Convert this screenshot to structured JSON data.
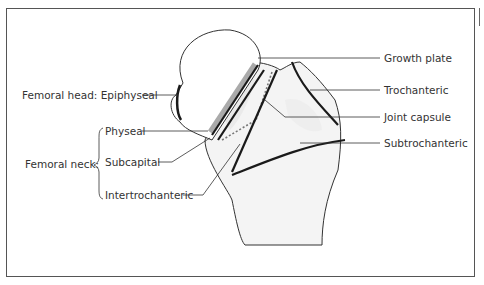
{
  "diagram": {
    "labels": {
      "femoral_head": "Femoral head: Epiphyseal",
      "femoral_neck_group": "Femoral neck:",
      "physeal": "Physeal",
      "subcapital": "Subcapital",
      "intertrochanteric": "Intertrochanteric",
      "growth_plate": "Growth plate",
      "trochanteric": "Trochanteric",
      "joint_capsule": "Joint capsule",
      "subtrochanteric": "Subtrochanteric"
    },
    "colors": {
      "outline": "#333333",
      "fracture_line": "#1a1a1a",
      "growth_plate": "#999999",
      "bone_fill": "#f4f4f4",
      "frame": "#555555"
    }
  }
}
